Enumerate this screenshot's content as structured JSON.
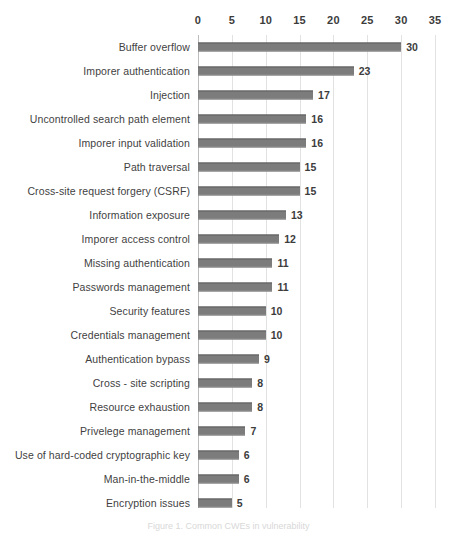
{
  "figure": {
    "caption": "Figure 1. Common CWEs in vulnerability"
  },
  "chart_data": {
    "type": "bar",
    "orientation": "horizontal",
    "title": "",
    "xlabel": "",
    "ylabel": "",
    "xlim": [
      0,
      35
    ],
    "xticks": [
      0,
      5,
      10,
      15,
      20,
      25,
      30,
      35
    ],
    "grid": true,
    "legend": false,
    "bar_color": "#7c7c7c",
    "grid_color": "#e2e2e2",
    "categories": [
      "Buffer overflow",
      "Imporer authentication",
      "Injection",
      "Uncontrolled search path element",
      "Imporer input validation",
      "Path traversal",
      "Cross-site request forgery (CSRF)",
      "Information exposure",
      "Imporer access control",
      "Missing authentication",
      "Passwords management",
      "Security features",
      "Credentials management",
      "Authentication bypass",
      "Cross - site scripting",
      "Resource exhaustion",
      "Privelege management",
      "Use of hard-coded cryptographic key",
      "Man-in-the-middle",
      "Encryption issues"
    ],
    "values": [
      30,
      23,
      17,
      16,
      16,
      15,
      15,
      13,
      12,
      11,
      11,
      10,
      10,
      9,
      8,
      8,
      7,
      6,
      6,
      5
    ]
  }
}
